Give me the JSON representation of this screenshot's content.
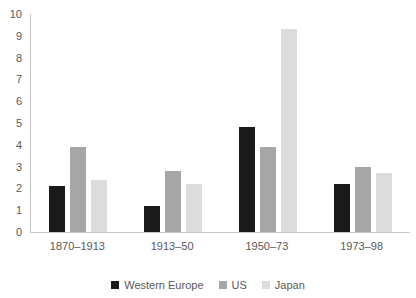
{
  "chart_data": {
    "type": "bar",
    "title": "",
    "categories": [
      "1870–1913",
      "1913–50",
      "1950–73",
      "1973–98"
    ],
    "series": [
      {
        "name": "Western Europe",
        "color": "#1a1a1a",
        "values": [
          2.1,
          1.2,
          4.8,
          2.2
        ]
      },
      {
        "name": "US",
        "color": "#a6a6a6",
        "values": [
          3.9,
          2.8,
          3.9,
          3.0
        ]
      },
      {
        "name": "Japan",
        "color": "#dcdcdc",
        "values": [
          2.4,
          2.2,
          9.3,
          2.7
        ]
      }
    ],
    "xlabel": "",
    "ylabel": "",
    "ylim": [
      0,
      10
    ],
    "ytick_step": 1,
    "grid": false,
    "legend_position": "bottom",
    "axis_color": "#c6c6c6",
    "text_color": "#595959",
    "background_color": "#ffffff"
  }
}
